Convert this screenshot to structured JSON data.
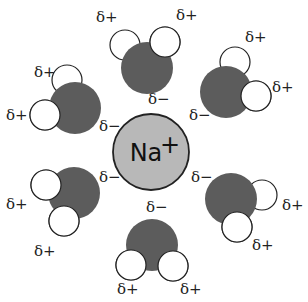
{
  "diagram": {
    "colors": {
      "ion_fill": "#b8b8b8",
      "oxygen_fill": "#5c5c5c",
      "hydrogen_fill": "#ffffff",
      "outline": "#222222"
    },
    "ion": {
      "label": "Na",
      "charge": "+",
      "cx": 151,
      "cy": 152,
      "r": 38
    },
    "labels": {
      "partial_positive": "δ+",
      "partial_negative": "δ−"
    },
    "molecules": [
      {
        "name": "top",
        "o": [
          147,
          68
        ],
        "h": [
          [
            125,
            45
          ],
          [
            165,
            42
          ]
        ],
        "plus": [
          [
            96,
            22
          ],
          [
            176,
            20
          ]
        ],
        "minus": [
          148,
          104
        ]
      },
      {
        "name": "top-right",
        "o": [
          226,
          92
        ],
        "h": [
          [
            235,
            62
          ],
          [
            256,
            96
          ]
        ],
        "plus": [
          [
            245,
            42
          ],
          [
            272,
            92
          ]
        ],
        "minus": [
          189,
          120
        ]
      },
      {
        "name": "top-left",
        "o": [
          75,
          108
        ],
        "h": [
          [
            67,
            80
          ],
          [
            45,
            115
          ]
        ],
        "plus": [
          [
            34,
            77
          ],
          [
            6,
            120
          ]
        ],
        "minus": [
          99,
          131
        ]
      },
      {
        "name": "bottom-left",
        "o": [
          74,
          193
        ],
        "h": [
          [
            46,
            185
          ],
          [
            64,
            221
          ]
        ],
        "plus": [
          [
            6,
            209
          ],
          [
            34,
            256
          ]
        ],
        "minus": [
          99,
          182
        ]
      },
      {
        "name": "bottom-right",
        "o": [
          231,
          199
        ],
        "h": [
          [
            262,
            195
          ],
          [
            237,
            227
          ]
        ],
        "plus": [
          [
            282,
            210
          ],
          [
            252,
            250
          ]
        ],
        "minus": [
          191,
          182
        ]
      },
      {
        "name": "bottom",
        "o": [
          152,
          245
        ],
        "h": [
          [
            131,
            265
          ],
          [
            173,
            266
          ]
        ],
        "plus": [
          [
            117,
            294
          ],
          [
            180,
            294
          ]
        ],
        "minus": [
          146,
          212
        ]
      }
    ]
  }
}
